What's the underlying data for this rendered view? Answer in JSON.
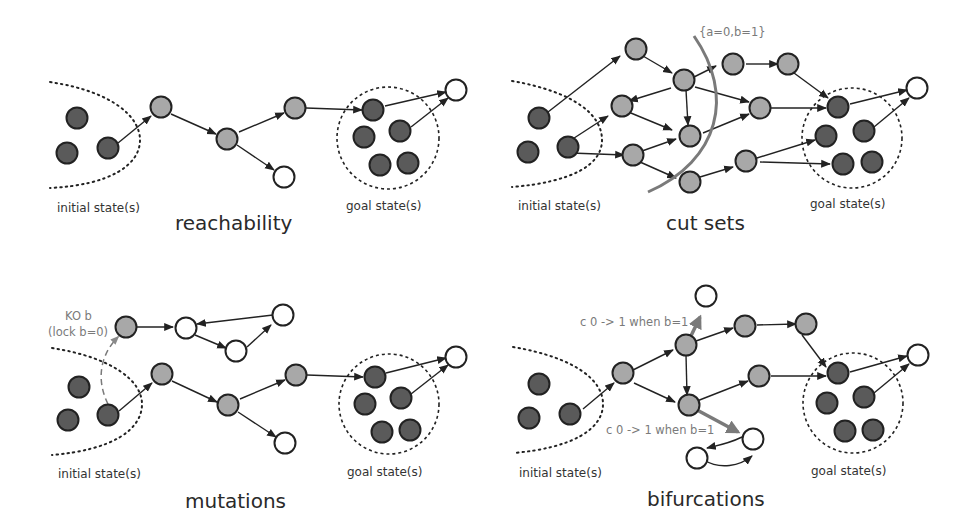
{
  "colors": {
    "dark_node": "#5a5a5a",
    "grey_node": "#a8a8a8",
    "white_node": "#ffffff",
    "edge": "#222222",
    "highlight": "#7a7a7a"
  },
  "panels": {
    "reachability": {
      "title": "reachability",
      "initial_label": "initial state(s)",
      "goal_label": "goal state(s)"
    },
    "cut_sets": {
      "title": "cut sets",
      "initial_label": "initial state(s)",
      "goal_label": "goal state(s)",
      "cut_annotation": "{a=0,b=1}"
    },
    "mutations": {
      "title": "mutations",
      "initial_label": "initial state(s)",
      "goal_label": "goal state(s)",
      "ko_line1": "KO b",
      "ko_line2": "(lock b=0)"
    },
    "bifurcations": {
      "title": "bifurcations",
      "initial_label": "initial state(s)",
      "goal_label": "goal state(s)",
      "bif_top": "c 0 -> 1 when b=1",
      "bif_bottom": "c 0 -> 1 when b=1"
    }
  }
}
